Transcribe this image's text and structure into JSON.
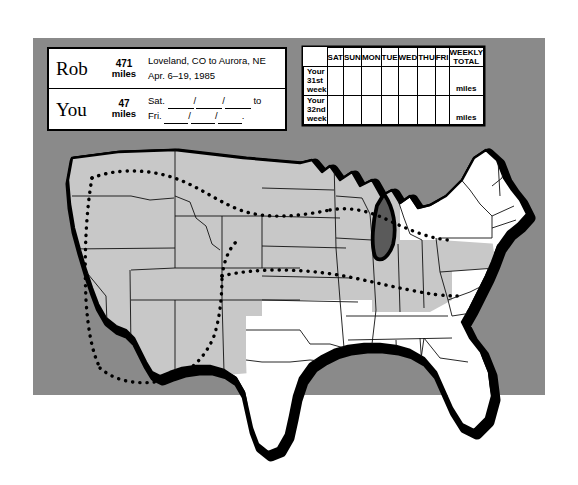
{
  "panel": {
    "background_color": "#8a8a8a"
  },
  "info_card": {
    "rows": [
      {
        "name": "Rob",
        "miles_number": "471",
        "miles_unit": "miles",
        "line1": "Loveland, CO to Aurora, NE",
        "line2": "Apr. 6–19, 1985"
      },
      {
        "name": "You",
        "miles_number": "47",
        "miles_unit": "miles",
        "line1_prefix": "Sat.",
        "line1_suffix": "to",
        "line2_prefix": "Fri.",
        "line2_suffix": "."
      }
    ]
  },
  "weekly_table": {
    "columns": [
      "SAT",
      "SUN",
      "MON",
      "TUE",
      "WED",
      "THU",
      "FRI",
      "WEEKLY TOTAL"
    ],
    "rows": [
      {
        "label_line1": "Your",
        "label_line2": "31st",
        "label_line3": "week",
        "values": [
          "",
          "",
          "",
          "",
          "",
          "",
          ""
        ],
        "total_unit": "miles"
      },
      {
        "label_line1": "Your",
        "label_line2": "32nd",
        "label_line3": "week",
        "values": [
          "",
          "",
          "",
          "",
          "",
          "",
          ""
        ],
        "total_unit": "miles"
      }
    ]
  },
  "map": {
    "title": "United States outline map",
    "shaded_region_note": "northern and western states shaded gray",
    "route_note": "dotted route line across shaded states",
    "colors": {
      "state_fill_shaded": "#c8c8c8",
      "state_fill_plain": "#ffffff",
      "outline": "#000000",
      "lake_fill": "#5a5a5a",
      "backdrop": "#8a8a8a"
    }
  }
}
